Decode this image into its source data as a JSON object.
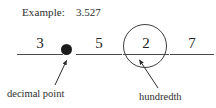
{
  "header": {
    "label": "Example:",
    "value": "3.527"
  },
  "places": [
    {
      "name": "ones",
      "digit": "3"
    },
    {
      "name": "tenths",
      "digit": "5"
    },
    {
      "name": "hundredths",
      "digit": "2"
    },
    {
      "name": "thousandths",
      "digit": "7"
    }
  ],
  "separator": {
    "name": "decimal-point",
    "glyph": "."
  },
  "annotations": [
    {
      "name": "decimal-point",
      "text": "decimal point"
    },
    {
      "name": "hundredth",
      "text": "hundredth"
    }
  ],
  "colors": {
    "ink": "#2b2b2b",
    "rule": "#4a4a4a",
    "dot": "#1a1a1a",
    "circle": "#3d3d3d",
    "background": "#ffffff"
  }
}
